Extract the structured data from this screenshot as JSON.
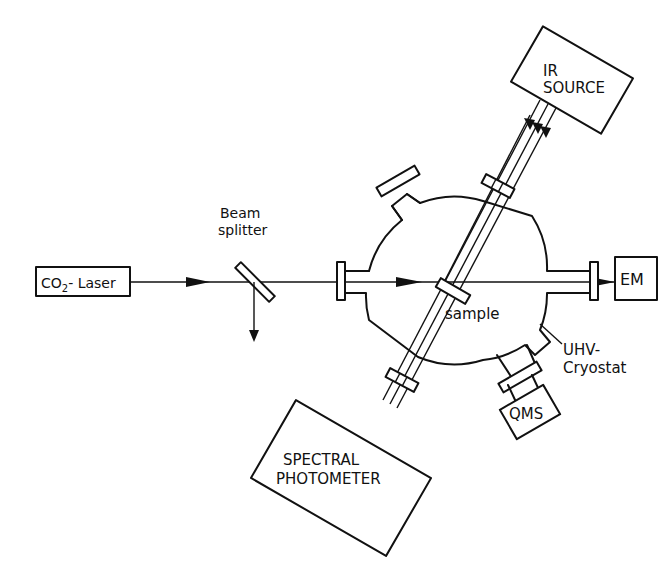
{
  "diagram": {
    "type": "experimental-setup",
    "colors": {
      "line": "#111111",
      "background": "#ffffff"
    },
    "components": {
      "laser": {
        "label_main": "CO",
        "label_sub": "2",
        "label_rest": "- Laser"
      },
      "beam_splitter": {
        "line1": "Beam",
        "line2": "splitter"
      },
      "sample": {
        "label": "sample"
      },
      "ir_source": {
        "line1": "IR",
        "line2": "SOURCE"
      },
      "em": {
        "label": "EM"
      },
      "cryostat": {
        "line1": "UHV-",
        "line2": "Cryostat"
      },
      "qms": {
        "label": "QMS"
      },
      "spectral_photometer": {
        "line1": "SPECTRAL",
        "line2": "PHOTOMETER"
      }
    }
  }
}
